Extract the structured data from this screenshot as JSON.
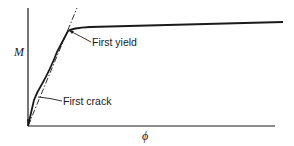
{
  "diagram": {
    "type": "moment-curvature",
    "axes": {
      "y_label": "M",
      "x_label": "ϕ"
    },
    "annotations": [
      {
        "id": "first_yield",
        "label": "First yield"
      },
      {
        "id": "first_crack",
        "label": "First crack"
      }
    ],
    "curves": [
      {
        "name": "actual-moment-curvature",
        "style": "solid"
      },
      {
        "name": "idealized-elastic-line",
        "style": "dashed"
      }
    ],
    "colors": {
      "line": "#1a1a1a",
      "background": "#ffffff"
    }
  }
}
